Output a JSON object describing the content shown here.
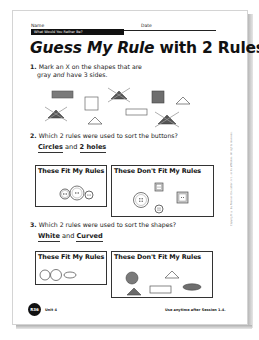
{
  "header": {
    "name_label": "Name",
    "date_label": "Date",
    "banner": "What Would You Rather Be?"
  },
  "title": {
    "italic_part": "Guess My Rule",
    "rest": " with 2 Rules"
  },
  "questions": [
    {
      "number": "1.",
      "text_line1": "Mark an X on the shapes that are",
      "text_line2_a": "gray ",
      "text_line2_em": "and",
      "text_line2_b": " have 3 sides.",
      "shapes": [
        {
          "type": "rectangle",
          "fill": "gray",
          "marked": false
        },
        {
          "type": "square",
          "fill": "white",
          "marked": false
        },
        {
          "type": "triangle",
          "fill": "gray",
          "marked": true
        },
        {
          "type": "square",
          "fill": "gray",
          "marked": false
        },
        {
          "type": "triangle",
          "fill": "white",
          "marked": false
        },
        {
          "type": "triangle",
          "fill": "gray",
          "marked": true
        },
        {
          "type": "triangle",
          "fill": "white",
          "marked": false
        },
        {
          "type": "rectangle",
          "fill": "white",
          "marked": false
        },
        {
          "type": "triangle",
          "fill": "gray",
          "marked": true
        }
      ]
    },
    {
      "number": "2.",
      "text": "Which 2 rules were used to sort the buttons?",
      "answer_a": "Circles",
      "answer_and": " and ",
      "answer_b": "2 holes",
      "fit_title": "These Fit My Rules",
      "dont_fit_title": "These Don't Fit My Rules",
      "fit_items": [
        "circle button, 2 holes",
        "circle button, 2 holes",
        "circle button, 2 holes"
      ],
      "dont_fit_items": [
        "circle button, 4 holes",
        "square button, 2 holes",
        "square button, 2 holes",
        "circle button, 4 holes"
      ]
    },
    {
      "number": "3.",
      "text": "Which 2 rules were used to sort the shapes?",
      "answer_a": "White",
      "answer_and": " and ",
      "answer_b": "Curved",
      "fit_title": "These Fit My Rules",
      "dont_fit_title": "These Don't Fit My Rules",
      "fit_items": [
        "white circle",
        "white circle",
        "white oval"
      ],
      "dont_fit_items": [
        "gray circle",
        "white triangle",
        "gray triangle",
        "white rectangle",
        "gray oval"
      ]
    }
  ],
  "footer": {
    "page_badge": "R36",
    "unit": "Unit 4",
    "note": "Use anytime after Session 1.4."
  },
  "side_note": "Copyright © by Pearson Education, Inc., or its affiliates. All rights reserved."
}
